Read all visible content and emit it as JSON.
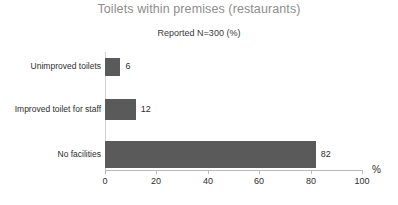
{
  "chart_data": {
    "type": "bar",
    "orientation": "horizontal",
    "title": "Toilets within premises (restaurants)",
    "subtitle": "Reported N=300 (%)",
    "xlabel": "%",
    "ylabel": "",
    "xlim": [
      0,
      100
    ],
    "xticks": [
      0,
      20,
      40,
      60,
      80,
      100
    ],
    "xtick_labels": [
      "0",
      "20",
      "40",
      "60",
      "80",
      "100"
    ],
    "grid": false,
    "legend": false,
    "categories": [
      "Unimproved toilets",
      "Improved toilet for staff",
      "No facilities"
    ],
    "values": [
      6,
      12,
      82
    ],
    "value_labels": [
      "6",
      "12",
      "82"
    ],
    "bar_color": "#5a5a5a",
    "title_color": "#8d8d8d",
    "text_color": "#2e2e2e",
    "axis_color": "#b9b9b9",
    "background": "#ffffff"
  },
  "bottom_artifact": "          "
}
